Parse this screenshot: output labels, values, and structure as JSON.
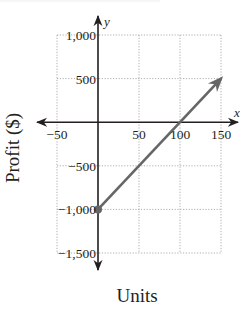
{
  "chart_data": {
    "type": "line",
    "title": "",
    "xlabel": "Units",
    "ylabel": "Profit ($)",
    "x_axis_var": "x",
    "y_axis_var": "y",
    "xlim": [
      -50,
      150
    ],
    "ylim": [
      -1500,
      1000
    ],
    "x_ticks": [
      -50,
      50,
      100,
      150
    ],
    "x_tick_labels": [
      "−50",
      "50",
      "100",
      "150"
    ],
    "y_ticks": [
      1000,
      500,
      -500,
      -1000,
      -1500
    ],
    "y_tick_labels": [
      "1,000",
      "500",
      "−500",
      "−1,000",
      "−1,500"
    ],
    "grid": true,
    "series": [
      {
        "name": "Profit",
        "color": "#666666",
        "points": [
          [
            0,
            -1000
          ],
          [
            150,
            500
          ]
        ],
        "start_marker": "filled-dot",
        "end_marker": "arrow"
      }
    ],
    "x_intercept": 100,
    "y_intercept": -1000
  }
}
